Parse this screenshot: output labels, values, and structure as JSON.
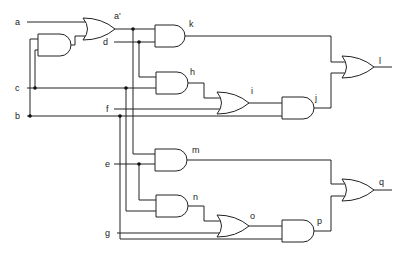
{
  "diagram": {
    "type": "logic-circuit",
    "inputs": {
      "a": "a",
      "b": "b",
      "c": "c",
      "d": "d",
      "e": "e",
      "f": "f",
      "g": "g"
    },
    "gates": {
      "a_prime": {
        "label": "a'",
        "type": "OR"
      },
      "bc_and": {
        "label": "",
        "type": "AND"
      },
      "k": {
        "label": "k",
        "type": "AND"
      },
      "h": {
        "label": "h",
        "type": "AND"
      },
      "i": {
        "label": "i",
        "type": "OR"
      },
      "j": {
        "label": "j",
        "type": "AND"
      },
      "l": {
        "label": "l",
        "type": "OR"
      },
      "m": {
        "label": "m",
        "type": "AND"
      },
      "n": {
        "label": "n",
        "type": "AND"
      },
      "o": {
        "label": "o",
        "type": "OR"
      },
      "p": {
        "label": "p",
        "type": "AND"
      },
      "q": {
        "label": "q",
        "type": "OR"
      }
    },
    "connections": [
      "a' = OR(a, AND(b, c))",
      "k = AND(a', d)",
      "h = AND(d, c)",
      "i = OR(h, f)",
      "j = AND(i, b)",
      "l = OR(k, j)",
      "m = AND(a', e)",
      "n = AND(e, c)",
      "o = OR(n, g)",
      "p = AND(o, b)",
      "q = OR(m, p)"
    ]
  }
}
